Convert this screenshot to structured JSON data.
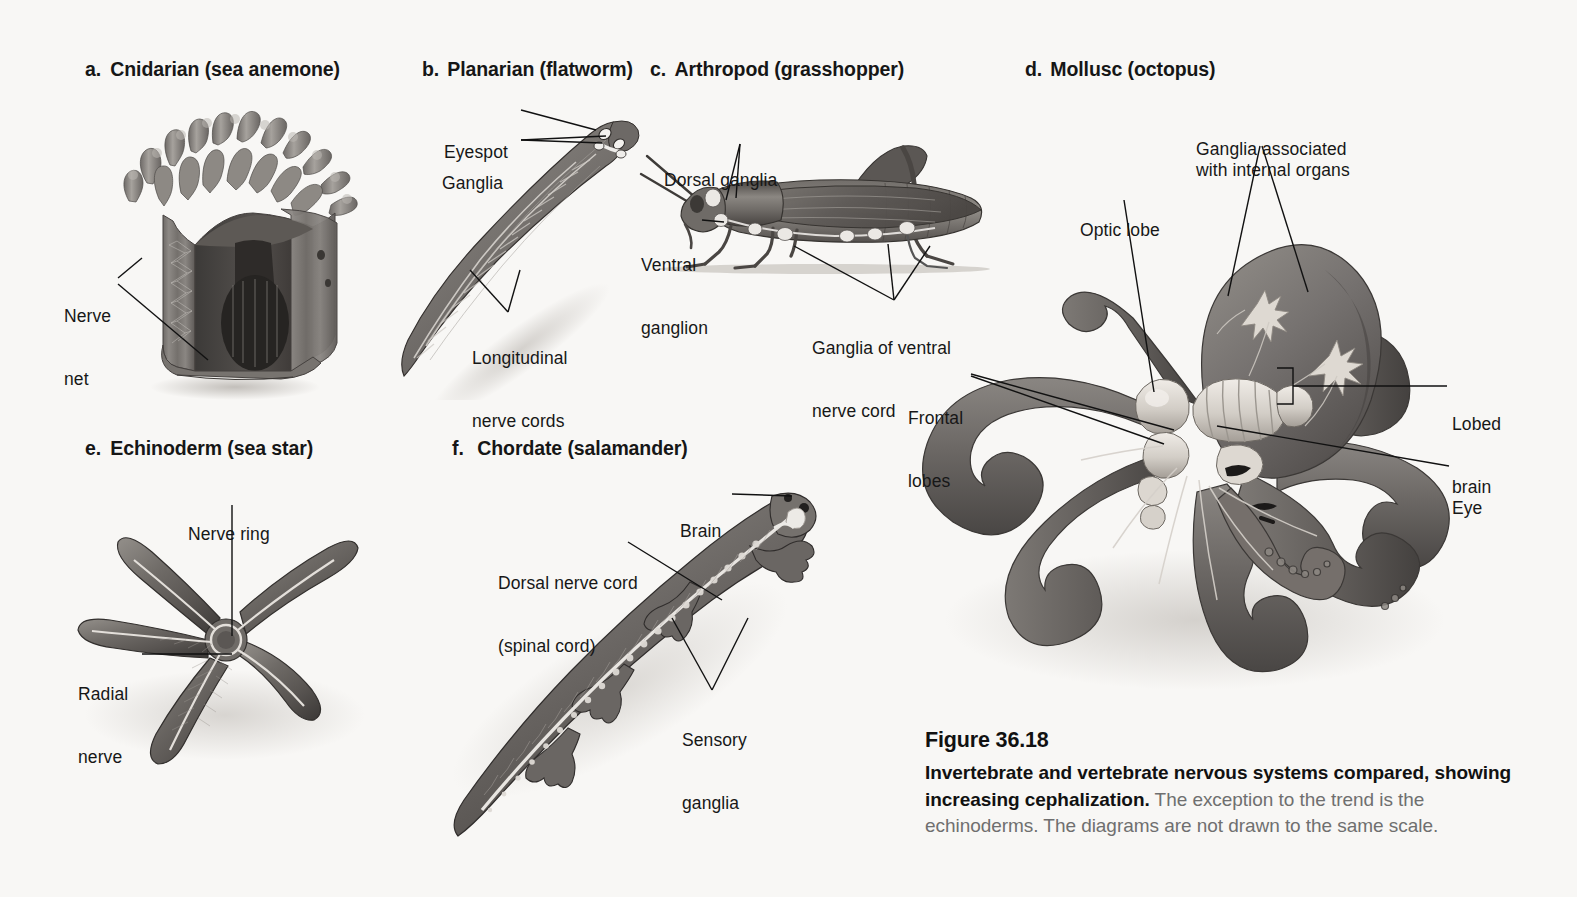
{
  "figure": {
    "number": "Figure 36.18",
    "caption_bold": "Invertebrate and vertebrate nervous systems compared, showing increasing cephalization.",
    "caption_rest": " The exception to the trend is the echinoderms. The diagrams are not drawn to the same scale.",
    "background_color": "#f8f7f5",
    "ink_color": "#171717"
  },
  "panels": [
    {
      "key": "a",
      "letter": "a.",
      "title": "Cnidarian (sea anemone)",
      "organism": "sea-anemone",
      "labels": [
        {
          "key": "nerve_net",
          "line1": "Nerve",
          "line2": "net"
        }
      ]
    },
    {
      "key": "b",
      "letter": "b.",
      "title": "Planarian (flatworm)",
      "organism": "planarian",
      "labels": [
        {
          "key": "eyespot",
          "line1": "Eyespot",
          "line2": ""
        },
        {
          "key": "ganglia",
          "line1": "Ganglia",
          "line2": ""
        },
        {
          "key": "longitudinal_nerve_cords",
          "line1": "Longitudinal",
          "line2": "nerve cords"
        }
      ]
    },
    {
      "key": "c",
      "letter": "c.",
      "title": "Arthropod (grasshopper)",
      "organism": "grasshopper",
      "labels": [
        {
          "key": "dorsal_ganglia",
          "line1": "Dorsal ganglia",
          "line2": ""
        },
        {
          "key": "ventral_ganglion",
          "line1": "Ventral",
          "line2": "ganglion"
        },
        {
          "key": "ganglia_of_ventral_nerve_cord",
          "line1": "Ganglia of ventral",
          "line2": "nerve cord"
        }
      ]
    },
    {
      "key": "d",
      "letter": "d.",
      "title": "Mollusc (octopus)",
      "organism": "octopus",
      "labels": [
        {
          "key": "ganglia_internal_organs",
          "line1": "Ganglia associated",
          "line2": "with internal organs"
        },
        {
          "key": "optic_lobe",
          "line1": "Optic lobe",
          "line2": ""
        },
        {
          "key": "frontal_lobes",
          "line1": "Frontal",
          "line2": "lobes"
        },
        {
          "key": "lobed_brain",
          "line1": "Lobed",
          "line2": "brain"
        },
        {
          "key": "eye",
          "line1": "Eye",
          "line2": ""
        }
      ]
    },
    {
      "key": "e",
      "letter": "e.",
      "title": "Echinoderm (sea star)",
      "organism": "sea-star",
      "labels": [
        {
          "key": "nerve_ring",
          "line1": "Nerve ring",
          "line2": ""
        },
        {
          "key": "radial_nerve",
          "line1": "Radial",
          "line2": "nerve"
        }
      ]
    },
    {
      "key": "f",
      "letter": "f.",
      "title": "Chordate (salamander)",
      "organism": "salamander",
      "labels": [
        {
          "key": "brain",
          "line1": "Brain",
          "line2": ""
        },
        {
          "key": "dorsal_nerve_cord",
          "line1": "Dorsal nerve cord",
          "line2": "(spinal cord)"
        },
        {
          "key": "sensory_ganglia",
          "line1": "Sensory",
          "line2": "ganglia"
        }
      ]
    }
  ]
}
